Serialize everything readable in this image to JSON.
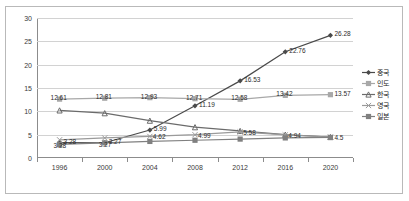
{
  "chart_data": {
    "type": "line",
    "title": "",
    "xlabel": "",
    "ylabel": "",
    "categories": [
      "1996",
      "2000",
      "2004",
      "2008",
      "2012",
      "2016",
      "2020"
    ],
    "ylim": [
      0,
      30
    ],
    "ytick_values": [
      0,
      5,
      10,
      15,
      20,
      25,
      30
    ],
    "ytick_labels": [
      "0",
      "5",
      "10",
      "15",
      "20",
      "25",
      "30"
    ],
    "grid": true,
    "legend_position": "right",
    "series": [
      {
        "name": "중국",
        "color": "#4a4a4a",
        "marker": "diamond",
        "values": [
          3.28,
          3.27,
          5.99,
          11.19,
          16.53,
          22.76,
          26.28
        ],
        "labels": [
          "3.28",
          "3.27",
          "5.99",
          "11.19",
          "16.53",
          "22.76",
          "26.28"
        ]
      },
      {
        "name": "인도",
        "color": "#a8a8a8",
        "marker": "square",
        "values": [
          12.61,
          12.81,
          12.93,
          12.71,
          12.58,
          13.42,
          13.57
        ],
        "labels": [
          "12.61",
          "12.81",
          "12.93",
          "12.71",
          "12.58",
          "13.42",
          "13.57"
        ]
      },
      {
        "name": "한국",
        "color": "#6b6b6b",
        "marker": "triangle",
        "values": [
          10.2,
          9.6,
          8.0,
          6.6,
          5.8,
          5.0,
          4.5
        ],
        "labels": [
          "",
          "",
          "",
          "",
          "",
          "",
          "4.5"
        ]
      },
      {
        "name": "영국",
        "color": "#9a9a9a",
        "marker": "cross",
        "values": [
          3.9,
          4.3,
          4.62,
          4.99,
          5.58,
          4.94,
          4.5
        ],
        "labels": [
          "",
          "",
          "4.62",
          "4.99",
          "5.58",
          "4.94",
          ""
        ]
      },
      {
        "name": "일본",
        "color": "#808080",
        "marker": "square-filled",
        "values": [
          2.9,
          3.25,
          3.55,
          3.8,
          4.05,
          4.3,
          4.4
        ],
        "labels": [
          "3.28",
          "3.27",
          "",
          "",
          "",
          "",
          ""
        ]
      }
    ]
  },
  "legend": {
    "items": [
      {
        "label": "중국"
      },
      {
        "label": "인도"
      },
      {
        "label": "한국"
      },
      {
        "label": "영국"
      },
      {
        "label": "일본"
      }
    ]
  }
}
